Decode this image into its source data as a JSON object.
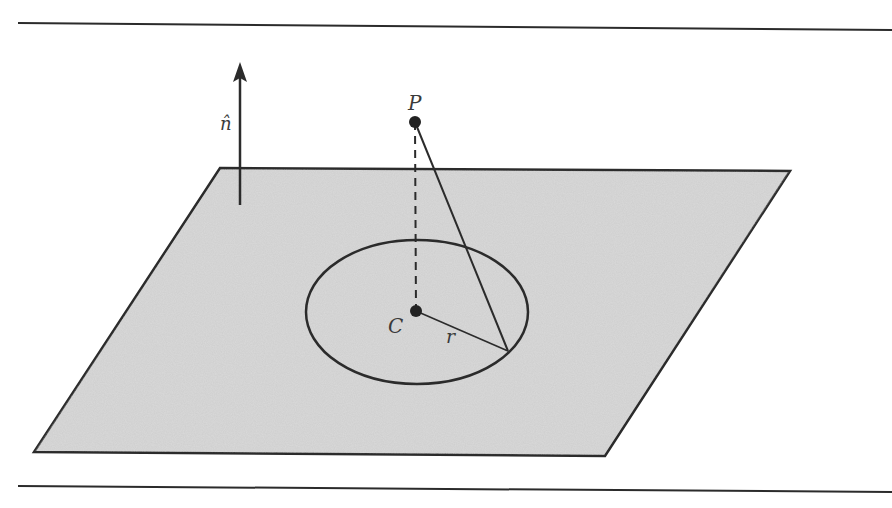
{
  "figure": {
    "colors": {
      "plane_fill": "#cccccc",
      "stroke": "#2b2b2b",
      "background": "#ffffff",
      "label": "#3a3a3a"
    },
    "labels": {
      "point_P": "P",
      "center_C": "C",
      "radius_r": "r",
      "normal_n": "n̂"
    },
    "plane": {
      "corners": [
        [
          220,
          168
        ],
        [
          790,
          171
        ],
        [
          605,
          456
        ],
        [
          34,
          452
        ]
      ]
    },
    "circle": {
      "cx": 417,
      "cy": 312,
      "rx": 111,
      "ry": 72
    },
    "points": {
      "P": [
        415,
        122
      ],
      "C": [
        416,
        311
      ],
      "rim": [
        508,
        351
      ]
    },
    "normal_arrow": {
      "x": 240,
      "y_tail": 205,
      "y_tip": 62
    },
    "rules": {
      "top": [
        [
          18,
          23
        ],
        [
          892,
          30
        ]
      ],
      "bottom": [
        [
          18,
          486
        ],
        [
          892,
          492
        ]
      ]
    }
  }
}
